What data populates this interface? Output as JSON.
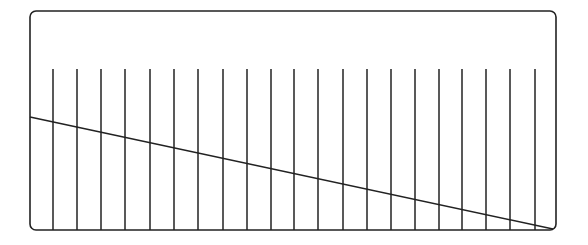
{
  "diagram": {
    "canvas": {
      "width": 588,
      "height": 245,
      "background": "#ffffff"
    },
    "stroke_color": "#222222",
    "frame": {
      "x": 30,
      "y": 11,
      "width": 526,
      "height": 219,
      "corner_radius": 6,
      "stroke_width": 1.6
    },
    "vertical_lines": {
      "top_y": 69,
      "bottom_y": 230,
      "stroke_width": 1.5,
      "x_positions": [
        53,
        77,
        101,
        125,
        150,
        174,
        198,
        223,
        247,
        271,
        294,
        318,
        343,
        367,
        391,
        415,
        439,
        462,
        486,
        510,
        535
      ]
    },
    "diagonal_line": {
      "x1": 30,
      "y1": 117,
      "x2": 553,
      "y2": 229,
      "stroke_width": 1.6
    }
  }
}
